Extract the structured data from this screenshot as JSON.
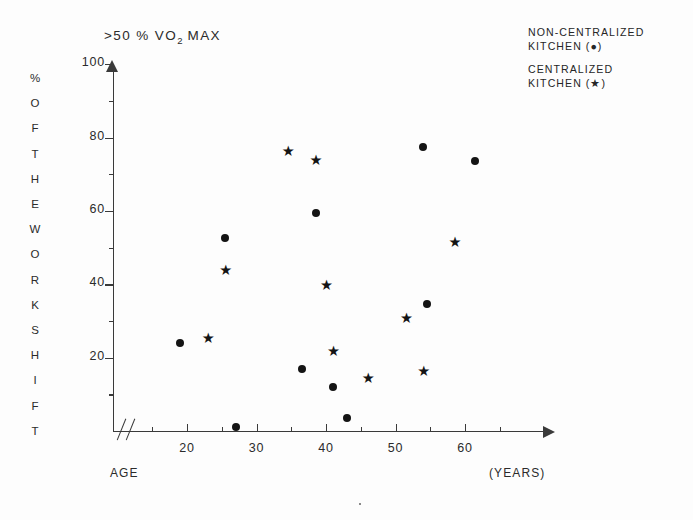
{
  "chart_data": {
    "type": "scatter",
    "title": ">50 % VO2 MAX",
    "title_main": ">50 % VO",
    "title_sub": "2",
    "title_tail": " MAX",
    "xlabel": "AGE",
    "xunit": "(YEARS)",
    "ylabel": "% OF THE WORK SHIFT",
    "ylabel_letters": [
      "%",
      "O",
      "F",
      "T",
      "H",
      "E",
      "W",
      "O",
      "R",
      "K",
      "S",
      "H",
      "I",
      "F",
      "T"
    ],
    "xlim": [
      14,
      65
    ],
    "ylim": [
      0,
      100
    ],
    "axis_break": true,
    "grid": false,
    "legend_position": "top-right",
    "xticks": [
      20,
      30,
      40,
      50,
      60
    ],
    "xticks_minor": [
      15,
      25,
      35,
      45,
      55,
      65
    ],
    "yticks": [
      20,
      40,
      60,
      80,
      100
    ],
    "yticks_minor": [
      10,
      30,
      50,
      70,
      90
    ],
    "xtick_labels": [
      "20",
      "30",
      "40",
      "50",
      "60"
    ],
    "ytick_labels": [
      "20",
      "40",
      "60",
      "80",
      "100"
    ],
    "series": [
      {
        "name": "NON-CENTRALIZED KITCHEN",
        "marker": "dot",
        "legend_line1": "NON-CENTRALIZED",
        "legend_line2": "KITCHEN (●)",
        "points": [
          {
            "x": 19.0,
            "y": 24.0
          },
          {
            "x": 25.5,
            "y": 52.5
          },
          {
            "x": 27.0,
            "y": 1.0
          },
          {
            "x": 36.5,
            "y": 17.0
          },
          {
            "x": 38.5,
            "y": 59.5
          },
          {
            "x": 41.0,
            "y": 12.0
          },
          {
            "x": 43.0,
            "y": 3.5
          },
          {
            "x": 54.0,
            "y": 77.5
          },
          {
            "x": 54.5,
            "y": 34.5
          },
          {
            "x": 61.5,
            "y": 73.5
          }
        ]
      },
      {
        "name": "CENTRALIZED KITCHEN",
        "marker": "star",
        "legend_line1": "CENTRALIZED",
        "legend_line2": "KITCHEN (★)",
        "points": [
          {
            "x": 23.0,
            "y": 23.5
          },
          {
            "x": 25.5,
            "y": 42.0
          },
          {
            "x": 34.5,
            "y": 74.5
          },
          {
            "x": 38.5,
            "y": 72.0
          },
          {
            "x": 40.0,
            "y": 38.0
          },
          {
            "x": 41.0,
            "y": 20.0
          },
          {
            "x": 46.0,
            "y": 12.5
          },
          {
            "x": 51.5,
            "y": 29.0
          },
          {
            "x": 54.0,
            "y": 14.5
          },
          {
            "x": 58.5,
            "y": 49.5
          }
        ]
      }
    ]
  },
  "colors": {
    "ink": "#141414",
    "axis": "#3a3a3a",
    "paper": "#fdfdfd"
  },
  "markers": {
    "dot_glyph": "●",
    "star_glyph": "★"
  }
}
